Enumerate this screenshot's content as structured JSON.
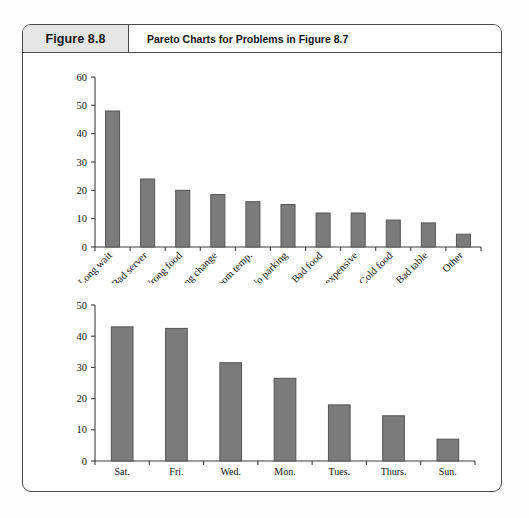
{
  "header": {
    "figure_label": "Figure 8.8",
    "title": "Pareto Charts for Problems in Figure 8.7"
  },
  "chart_data": [
    {
      "type": "bar",
      "id": "problems-pareto",
      "title": "",
      "xlabel": "",
      "ylabel": "",
      "ylim": [
        0,
        60
      ],
      "ytick_step": 10,
      "yticks": [
        "0",
        "10",
        "20",
        "30",
        "40",
        "50",
        "60"
      ],
      "grid": false,
      "legend": "none",
      "xtick_rotation_deg": 45,
      "categories": [
        "Long wait",
        "Bad server",
        "Wrong food",
        "Wrong change",
        "Room temp.",
        "No parking",
        "Bad food",
        "Too expensive",
        "Cold food",
        "Bad table",
        "Other"
      ],
      "values": [
        48,
        24,
        20,
        18.5,
        16,
        15,
        12,
        12,
        9.5,
        8.5,
        4.5
      ]
    },
    {
      "type": "bar",
      "id": "days-pareto",
      "title": "",
      "xlabel": "",
      "ylabel": "",
      "ylim": [
        0,
        50
      ],
      "ytick_step": 10,
      "yticks": [
        "0",
        "10",
        "20",
        "30",
        "40",
        "50"
      ],
      "grid": false,
      "legend": "none",
      "xtick_rotation_deg": 0,
      "categories": [
        "Sat.",
        "Fri.",
        "Wed.",
        "Mon.",
        "Tues.",
        "Thurs.",
        "Sun."
      ],
      "values": [
        43,
        42.5,
        31.5,
        26.5,
        18,
        14.5,
        7
      ]
    }
  ],
  "colors": {
    "bar_fill": "#7b7b7b",
    "bar_stroke": "#555555",
    "frame": "#4a4a4a",
    "header_cell_bg": "#e6e6e6",
    "page_bg": "#fdfdfd"
  }
}
